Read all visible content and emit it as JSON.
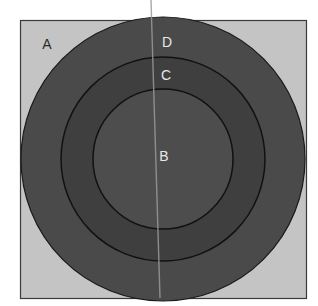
{
  "diagram": {
    "type": "concentric-circles-in-square",
    "colors": {
      "background": "#ffffff",
      "square_fill": "#c4c4c4",
      "square_border": "#3a3a3a",
      "ring_D_fill": "#4a4a4a",
      "ring_C_fill": "#3f3f3f",
      "disc_B_fill": "#4d4d4d",
      "circle_stroke": "#1a1a1a",
      "divider_line": "#9a9a9a"
    },
    "regions": [
      {
        "id": "A",
        "label": "A",
        "description": "square corner region outside the outer circle"
      },
      {
        "id": "D",
        "label": "D",
        "description": "outer ring"
      },
      {
        "id": "C",
        "label": "C",
        "description": "middle ring"
      },
      {
        "id": "B",
        "label": "B",
        "description": "inner disc"
      }
    ],
    "labels": {
      "A": "A",
      "B": "B",
      "C": "C",
      "D": "D"
    }
  }
}
